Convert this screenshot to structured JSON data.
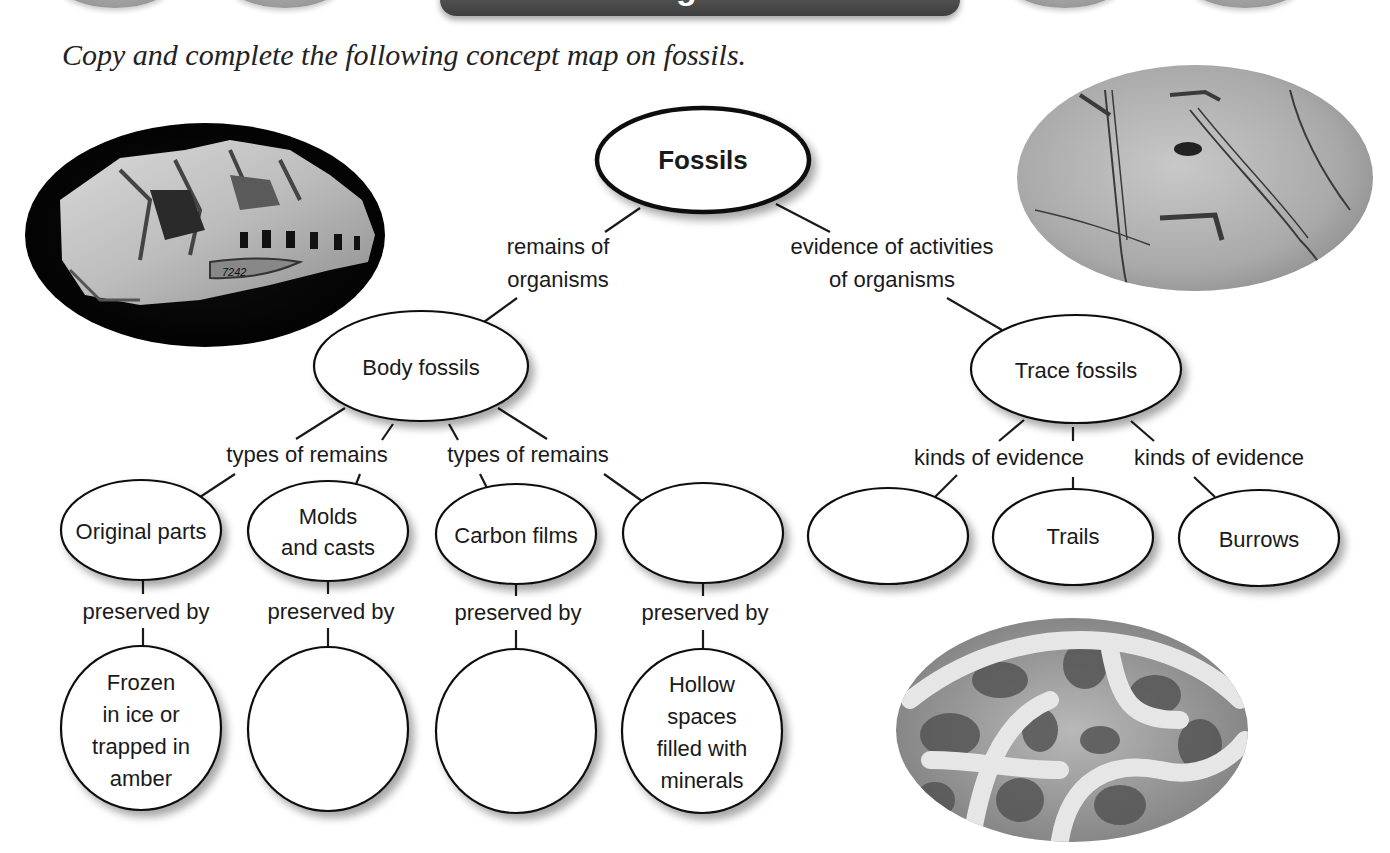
{
  "header": {
    "banner_title": "Visualizing Main Ideas"
  },
  "instruction": "Copy and complete the following concept map on fossils.",
  "concept_map": {
    "root": {
      "label": "Fossils"
    },
    "branches": {
      "left_link": [
        "remains of",
        "organisms"
      ],
      "right_link": [
        "evidence of activities",
        "of organisms"
      ]
    },
    "body_fossils": {
      "label": "Body fossils",
      "link_left": "types of remains",
      "link_right": "types of remains",
      "types": [
        {
          "label_lines": [
            "Original parts"
          ],
          "link": "preserved by",
          "preservation_lines": [
            "Frozen",
            "in ice or",
            "trapped in",
            "amber"
          ]
        },
        {
          "label_lines": [
            "Molds",
            "and casts"
          ],
          "link": "preserved by",
          "preservation_lines": []
        },
        {
          "label_lines": [
            "Carbon films"
          ],
          "link": "preserved by",
          "preservation_lines": []
        },
        {
          "label_lines": [],
          "link": "preserved by",
          "preservation_lines": [
            "Hollow",
            "spaces",
            "filled with",
            "minerals"
          ]
        }
      ]
    },
    "trace_fossils": {
      "label": "Trace fossils",
      "link_left": "kinds of evidence",
      "link_right": "kinds of evidence",
      "kinds": [
        {
          "label": ""
        },
        {
          "label": "Trails"
        },
        {
          "label": "Burrows"
        }
      ]
    }
  },
  "images": {
    "skull_fossil": {
      "specimen_label": "7242"
    },
    "trackway_fossil": {},
    "burrow_fossil": {}
  }
}
